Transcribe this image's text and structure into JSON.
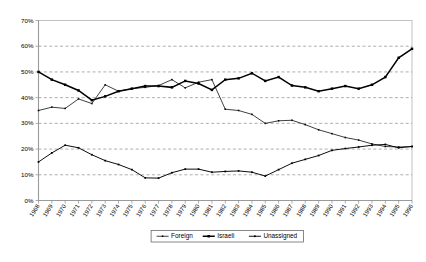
{
  "chart_data": {
    "type": "line",
    "title": "",
    "xlabel": "",
    "ylabel": "",
    "ylim": [
      0,
      70
    ],
    "yticks": [
      "0%",
      "10%",
      "20%",
      "30%",
      "40%",
      "50%",
      "60%",
      "70%"
    ],
    "ytick_values": [
      0,
      10,
      20,
      30,
      40,
      50,
      60,
      70
    ],
    "grid": true,
    "legend_position": "bottom-center",
    "x": [
      "1968",
      "1969",
      "1970",
      "1971",
      "1972",
      "1973",
      "1974",
      "1975",
      "1976",
      "1977",
      "1978",
      "1979",
      "1980",
      "1981",
      "1982",
      "1983",
      "1984",
      "1985",
      "1986",
      "1987",
      "1988",
      "1989",
      "1990",
      "1991",
      "1992",
      "1993",
      "1994",
      "1995",
      "1996"
    ],
    "categories": [
      "1968",
      "1969",
      "1970",
      "1971",
      "1972",
      "1973",
      "1974",
      "1975",
      "1976",
      "1977",
      "1978",
      "1979",
      "1980",
      "1981",
      "1982",
      "1983",
      "1984",
      "1985",
      "1986",
      "1987",
      "1988",
      "1989",
      "1990",
      "1991",
      "1992",
      "1993",
      "1994",
      "1995",
      "1996"
    ],
    "series": [
      {
        "name": "Foreign",
        "marker": "small-square",
        "values": [
          35.0,
          36.3,
          35.8,
          39.5,
          37.7,
          45.0,
          42.5,
          43.5,
          44.0,
          44.7,
          47.0,
          43.8,
          46.0,
          47.0,
          35.5,
          35.0,
          33.5,
          30.0,
          31.0,
          31.2,
          29.5,
          27.5,
          26.0,
          24.5,
          23.5,
          22.0,
          21.0,
          20.8,
          21.0
        ]
      },
      {
        "name": "Israeli",
        "marker": "bold-square",
        "values": [
          50.0,
          47.0,
          45.0,
          42.8,
          39.0,
          40.5,
          42.5,
          43.5,
          44.5,
          44.5,
          44.0,
          46.5,
          45.5,
          43.0,
          47.0,
          47.5,
          49.5,
          46.5,
          48.0,
          44.7,
          44.0,
          42.5,
          43.5,
          44.5,
          43.5,
          45.0,
          48.0,
          55.5,
          59.0
        ]
      },
      {
        "name": "Unassigned",
        "marker": "small-square",
        "values": [
          15.0,
          18.5,
          21.5,
          20.5,
          17.8,
          15.5,
          14.0,
          12.0,
          8.8,
          8.7,
          10.8,
          12.2,
          12.2,
          11.0,
          11.3,
          11.5,
          11.0,
          9.5,
          12.0,
          14.5,
          16.0,
          17.5,
          19.5,
          20.2,
          20.8,
          21.5,
          21.8,
          20.5,
          21.0
        ]
      }
    ]
  },
  "legend": {
    "items": [
      {
        "label": "Foreign"
      },
      {
        "label": "Israeli"
      },
      {
        "label": "Unassigned"
      }
    ]
  },
  "caption": ""
}
